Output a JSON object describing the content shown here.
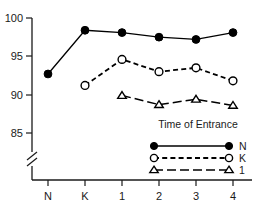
{
  "chart_data": {
    "type": "line",
    "title": "",
    "subtitle": "",
    "xlabel": "",
    "ylabel": "",
    "categories": [
      "N",
      "K",
      "1",
      "2",
      "3",
      "4"
    ],
    "ylim": [
      85,
      100
    ],
    "yticks": [
      85,
      90,
      95,
      100
    ],
    "ytick_labels": [
      "85",
      "90",
      "95",
      "100"
    ],
    "axis_break": true,
    "grid": false,
    "legend_position": "inside-lower-right",
    "legend_title": "Time of Entrance",
    "series": [
      {
        "name": "N",
        "marker": "filled-circle",
        "linestyle": "solid",
        "values": [
          92.7,
          98.4,
          98.1,
          97.5,
          97.2,
          98.1
        ]
      },
      {
        "name": "K",
        "marker": "open-circle",
        "linestyle": "dashed",
        "values": [
          null,
          91.2,
          94.6,
          93.0,
          93.5,
          91.8
        ]
      },
      {
        "name": "1",
        "marker": "open-triangle",
        "linestyle": "long-dashed",
        "values": [
          null,
          null,
          89.9,
          88.7,
          89.4,
          88.6
        ]
      }
    ],
    "colors": {
      "axis": "#1a1a1a",
      "series": "#000000",
      "background": "#ffffff"
    }
  },
  "yaxis": {
    "labels": [
      "100",
      "95",
      "90",
      "85"
    ]
  },
  "xaxis": {
    "labels": [
      "N",
      "K",
      "1",
      "2",
      "3",
      "4"
    ]
  },
  "legend": {
    "title": "Time of Entrance",
    "entries": [
      {
        "label": "N"
      },
      {
        "label": "K"
      },
      {
        "label": "1"
      }
    ]
  }
}
